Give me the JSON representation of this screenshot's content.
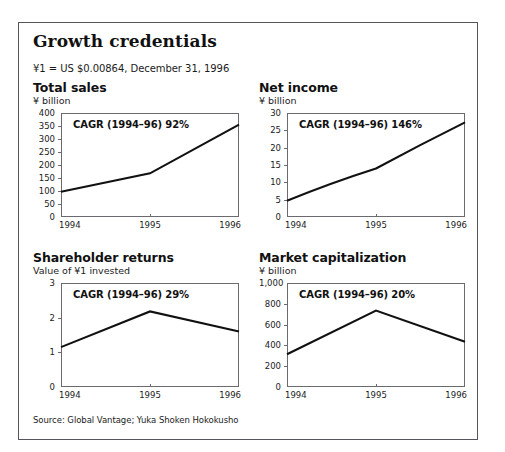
{
  "header": {
    "title": "Growth credentials",
    "fx_note": "¥1 = US $0.00864, December 31, 1996"
  },
  "footer": {
    "source": "Source: Global Vantage; Yuka Shoken Hokokusho"
  },
  "colors": {
    "line": "#111111",
    "axis": "#6a6a70",
    "frame": "#55555c",
    "text": "#1b1b1b",
    "background": "#ffffff"
  },
  "chart_data": [
    {
      "id": "total-sales",
      "type": "line",
      "title": "Total sales",
      "subtitle": "¥ billion",
      "annotation": "CAGR (1994–96) 92%",
      "xlabel": "",
      "ylabel": "¥ billion",
      "categories": [
        "1994",
        "1995",
        "1996"
      ],
      "x": [
        1994,
        1995,
        1996
      ],
      "values": [
        97,
        168,
        355
      ],
      "ylim": [
        0,
        400
      ],
      "yticks": [
        0,
        50,
        100,
        150,
        200,
        250,
        300,
        350,
        400
      ],
      "ytick_labels": [
        "0",
        "50",
        "100",
        "150",
        "200",
        "250",
        "300",
        "350",
        "400"
      ],
      "grid": false,
      "legend": "none"
    },
    {
      "id": "net-income",
      "type": "line",
      "title": "Net income",
      "subtitle": "¥ billion",
      "annotation": "CAGR (1994–96) 146%",
      "xlabel": "",
      "ylabel": "¥ billion",
      "categories": [
        "1994",
        "1995",
        "1996"
      ],
      "x": [
        1994,
        1995,
        1996
      ],
      "values": [
        4.7,
        14.0,
        27.3
      ],
      "ylim": [
        0,
        30
      ],
      "yticks": [
        0,
        5,
        10,
        15,
        20,
        25,
        30
      ],
      "ytick_labels": [
        "0",
        "5",
        "10",
        "15",
        "20",
        "25",
        "30"
      ],
      "grid": false,
      "legend": "none"
    },
    {
      "id": "shareholder-returns",
      "type": "line",
      "title": "Shareholder returns",
      "subtitle": "Value of ¥1 invested",
      "annotation": "CAGR (1994–96) 29%",
      "xlabel": "",
      "ylabel": "Value of ¥1 invested",
      "categories": [
        "1994",
        "1995",
        "1996"
      ],
      "x": [
        1994,
        1995,
        1996
      ],
      "values": [
        1.15,
        2.18,
        1.6
      ],
      "ylim": [
        0,
        3
      ],
      "yticks": [
        0,
        1,
        2,
        3
      ],
      "ytick_labels": [
        "0",
        "1",
        "2",
        "3"
      ],
      "grid": false,
      "legend": "none"
    },
    {
      "id": "market-capitalization",
      "type": "line",
      "title": "Market capitalization",
      "subtitle": "¥ billion",
      "annotation": "CAGR (1994–96) 20%",
      "xlabel": "",
      "ylabel": "¥ billion",
      "categories": [
        "1994",
        "1995",
        "1996"
      ],
      "x": [
        1994,
        1995,
        1996
      ],
      "values": [
        315,
        735,
        435
      ],
      "ylim": [
        0,
        1000
      ],
      "yticks": [
        0,
        200,
        400,
        600,
        800,
        1000
      ],
      "ytick_labels": [
        "0",
        "200",
        "400",
        "600",
        "800",
        "1,000"
      ],
      "grid": false,
      "legend": "none"
    }
  ]
}
